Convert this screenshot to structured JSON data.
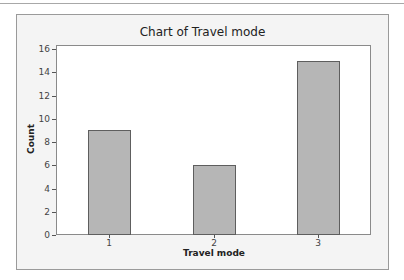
{
  "chart_data": {
    "type": "bar",
    "title": "Chart of Travel mode",
    "xlabel": "Travel mode",
    "ylabel": "Count",
    "categories": [
      "1",
      "2",
      "3"
    ],
    "values": [
      9,
      6,
      15
    ],
    "ylim": [
      0,
      16
    ],
    "yticks": [
      "0",
      "2",
      "4",
      "6",
      "8",
      "10",
      "12",
      "14",
      "16"
    ],
    "grid": false,
    "legend": null,
    "colors": {
      "bar": "#b6b6b6",
      "bar_border": "#5e5e5e",
      "frame_bg": "#f4f4f4",
      "plot_bg": "#ffffff"
    }
  }
}
